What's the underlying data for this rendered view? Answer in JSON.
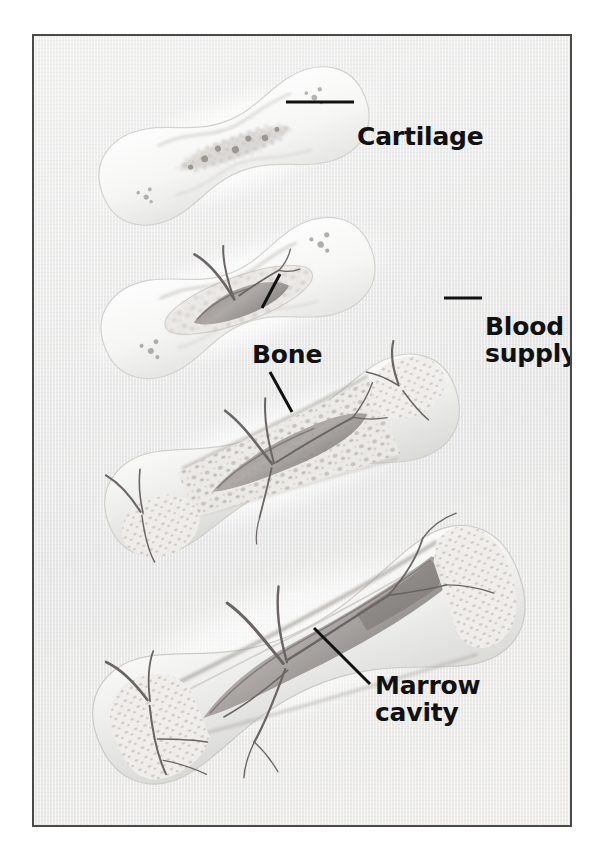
{
  "figure": {
    "kind": "anatomical-illustration",
    "style": "grayscale pencil illustration on textured paper",
    "border_color": "#4a4a4a",
    "background_color": "#ececec",
    "label_color": "#111111",
    "stage_count": 4
  },
  "labels": {
    "cartilage": "Cartilage",
    "bone": "Bone",
    "blood_line1": "Blood",
    "blood_line2": "supply",
    "marrow_line1": "Marrow",
    "marrow_line2": "cavity"
  },
  "stages": [
    {
      "index": 1,
      "name": "cartilage-model",
      "description": "Pale hyaline cartilage model, dumbbell shaped, with faint chondrocyte clusters at center and in both ends",
      "has_marrow_cavity": false,
      "has_blood_vessel": false
    },
    {
      "index": 2,
      "name": "primary-ossification-center",
      "description": "Primary ossification center forming in the shaft with a nutrient blood vessel entering; spongy bone appears centrally",
      "has_marrow_cavity": false,
      "has_blood_vessel": true
    },
    {
      "index": 3,
      "name": "marrow-cavity-forming",
      "description": "Medullary cavity opening in the diaphysis, trabecular bone along the shaft, secondary centers with vessels in the epiphyses",
      "has_marrow_cavity": true,
      "has_blood_vessel": true
    },
    {
      "index": 4,
      "name": "mature-long-bone",
      "description": "Mature long bone with large marrow cavity, thick cortical walls, spongy bone in the epiphyses and branching vasculature",
      "has_marrow_cavity": true,
      "has_blood_vessel": true
    }
  ],
  "leaders": [
    {
      "name": "cartilage",
      "points_to": "stage-1 epiphysis"
    },
    {
      "name": "bone-upper",
      "points_to": "stage-2 ossification center"
    },
    {
      "name": "bone-lower",
      "points_to": "stage-3 cortical bone"
    },
    {
      "name": "blood-supply",
      "points_to": "stage-3 epiphyseal vessel"
    },
    {
      "name": "marrow-cavity",
      "points_to": "stage-4 marrow cavity"
    }
  ]
}
